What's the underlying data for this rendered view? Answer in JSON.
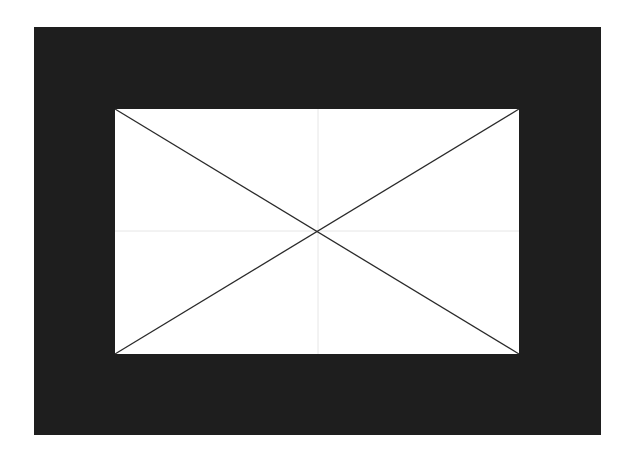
{
  "canvas": {
    "width": 634,
    "height": 459,
    "background": "#ffffff"
  },
  "frame": {
    "x": 34,
    "y": 27,
    "width": 567,
    "height": 408,
    "color": "#1e1e1e"
  },
  "panel": {
    "x": 115,
    "y": 109,
    "width": 404,
    "height": 245,
    "color": "#ffffff"
  },
  "crosshair": {
    "x": 318,
    "y": 231,
    "color": "#e6e6e6"
  },
  "diagonals": {
    "color": "#2a2a2a",
    "stroke_width": 1.3
  },
  "icon": "image-placeholder-icon"
}
